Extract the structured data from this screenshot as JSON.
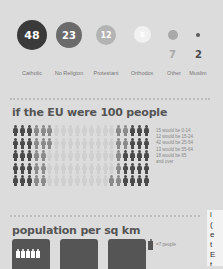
{
  "religions": {
    "items": [
      {
        "label": "Catholic",
        "value": "48",
        "color": "#3a3a3a"
      },
      {
        "label": "No Religion",
        "value": "23",
        "color": "#6b6b6b"
      },
      {
        "label": "Protestant",
        "value": "12",
        "color": "#b3b3b3"
      },
      {
        "label": "Orthodox",
        "value": "8",
        "color": "#f1f1f1"
      },
      {
        "label": "Other",
        "value": "7",
        "color": "#a9a9a9"
      },
      {
        "label": "Muslim",
        "value": "2",
        "color": "#5a5a5a"
      }
    ]
  },
  "eu100": {
    "title": "if the EU were 100 people",
    "legend": [
      "15 would be 0-14",
      "12 would be 15-24",
      "42 would be 25-54",
      "13 would be 55-64",
      "18 would be 65",
      "and over"
    ],
    "colors": {
      "dark": "#4a4a4a",
      "mid": "#8a8a8a",
      "light": "#cfcfcf"
    }
  },
  "density": {
    "title": "population per sq km",
    "key_label": "=7 people"
  },
  "side_text": {
    "lines": [
      "i",
      "(",
      "e",
      "t",
      "E",
      "t"
    ]
  }
}
